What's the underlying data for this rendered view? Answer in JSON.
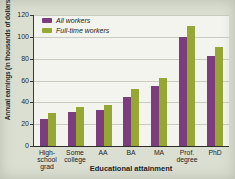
{
  "figure": {
    "background_color": "#dadfd2",
    "plot_background_color": "#f3f4ee",
    "gridline_color": "#c7ccbf",
    "axis_color": "#3a3a38",
    "text_color": "#222222"
  },
  "chart_data": {
    "type": "bar",
    "xlabel": "Educational attainment",
    "ylabel": "Annual earnings (in thousands of dollars)",
    "categories": [
      [
        "High-school",
        "grad"
      ],
      [
        "Some",
        "college"
      ],
      [
        "AA"
      ],
      [
        "BA"
      ],
      [
        "MA"
      ],
      [
        "Prof.",
        "degree"
      ],
      [
        "PhD"
      ]
    ],
    "series": [
      {
        "name": "All workers",
        "color": "#7c3d7e",
        "values": [
          25,
          31,
          33,
          45,
          55,
          100,
          82
        ]
      },
      {
        "name": "Full-time workers",
        "color": "#96a733",
        "values": [
          30,
          36,
          38,
          52,
          62,
          110,
          91
        ]
      }
    ],
    "ylim": [
      0,
      120
    ],
    "yticks": [
      0,
      20,
      40,
      60,
      80,
      100,
      120
    ],
    "grid": true,
    "legend_position": "top-left"
  }
}
